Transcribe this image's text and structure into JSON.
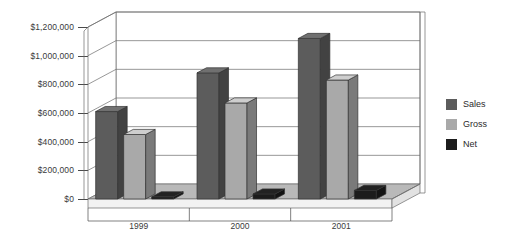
{
  "chart_data": {
    "type": "bar",
    "title": "",
    "xlabel": "",
    "ylabel": "",
    "categories": [
      "1999",
      "2000",
      "2001"
    ],
    "series": [
      {
        "name": "Sales",
        "color": "#5c5c5c",
        "values": [
          610000,
          880000,
          1120000
        ]
      },
      {
        "name": "Gross",
        "color": "#a9a9a9",
        "values": [
          450000,
          670000,
          830000
        ]
      },
      {
        "name": "Net",
        "color": "#1c1c1c",
        "values": [
          15000,
          35000,
          60000
        ]
      }
    ],
    "ylim": [
      0,
      1200000
    ],
    "yticks": [
      0,
      200000,
      400000,
      600000,
      800000,
      1000000,
      1200000
    ],
    "ytick_labels": [
      "$0",
      "$200,000",
      "$400,000",
      "$600,000",
      "$800,000",
      "$1,000,000",
      "$1,200,000"
    ],
    "grid": true,
    "legend_position": "right",
    "style": "3d-column"
  },
  "legend": {
    "items": [
      {
        "label": "Sales",
        "color": "#5c5c5c"
      },
      {
        "label": "Gross",
        "color": "#a9a9a9"
      },
      {
        "label": "Net",
        "color": "#1c1c1c"
      }
    ]
  }
}
